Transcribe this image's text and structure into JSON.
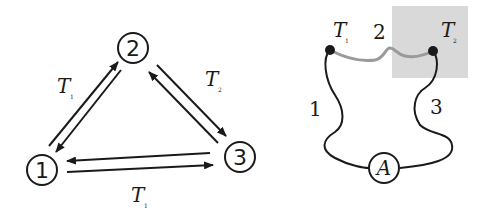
{
  "left_diagram": {
    "nodes": [
      {
        "id": "1",
        "label": "1"
      },
      {
        "id": "2",
        "label": "2"
      },
      {
        "id": "3",
        "label": "3"
      }
    ],
    "edge_labels": {
      "edge_12": {
        "main": "T",
        "sub": "1"
      },
      "edge_23": {
        "main": "T",
        "sub": "2"
      },
      "edge_13": {
        "main": "T",
        "sub": "1"
      }
    }
  },
  "right_diagram": {
    "junctions": {
      "left": {
        "main": "T",
        "sub": "1"
      },
      "right": {
        "main": "T",
        "sub": "2"
      }
    },
    "wire_labels": {
      "wire1": "1",
      "wire2": "2",
      "wire3": "3"
    },
    "meter": "A",
    "colors": {
      "shaded_region": "#d9d9d9",
      "wire2": "#9a9a9a",
      "wires": "#1a1a1a"
    }
  }
}
